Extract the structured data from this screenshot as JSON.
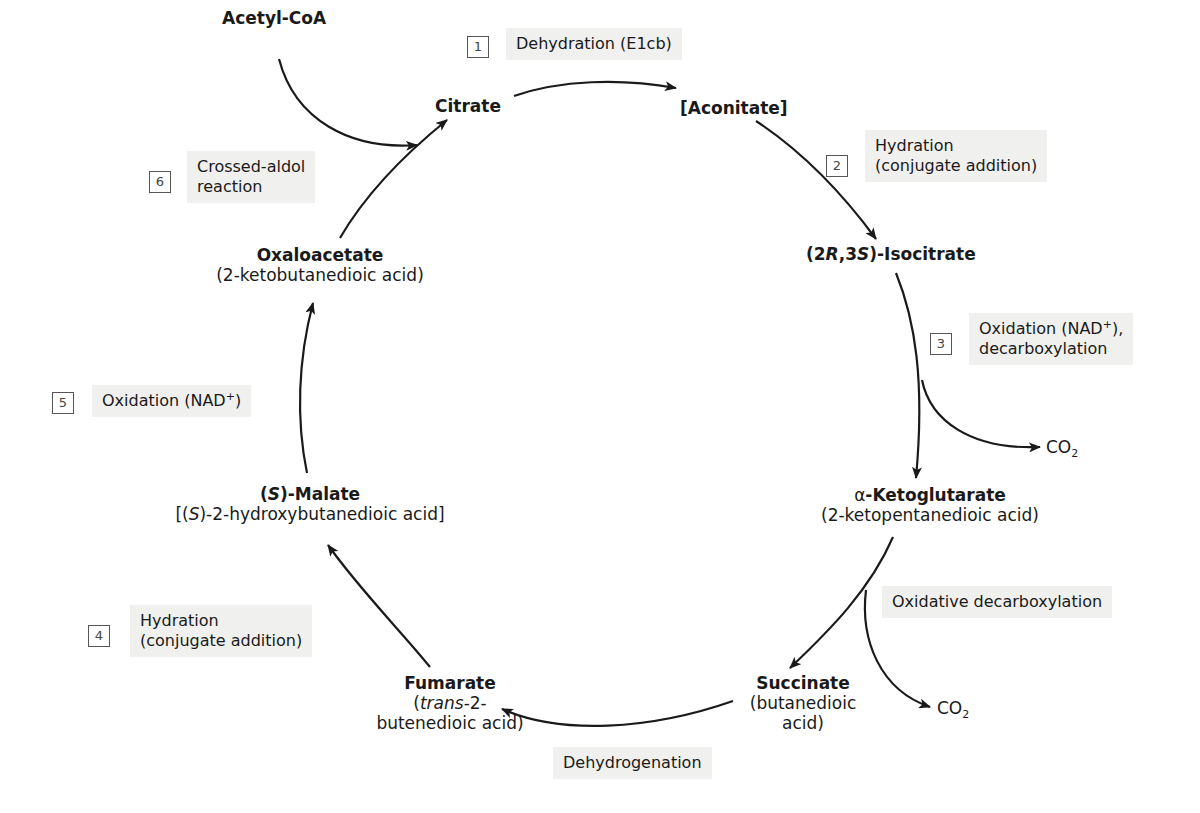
{
  "compounds": {
    "acetyl_coa": "Acetyl-CoA",
    "citrate": "Citrate",
    "aconitate": "[Aconitate]",
    "isocitrate_prefix": "(2",
    "isocitrate_r": "R",
    "isocitrate_mid": ",3",
    "isocitrate_s": "S",
    "isocitrate_suffix": ")-Isocitrate",
    "ketoglutarate_alpha": "α",
    "ketoglutarate_name": "-Ketoglutarate",
    "ketoglutarate_iupac": "(2-ketopentanedioic acid)",
    "succinate": "Succinate",
    "succinate_iupac_1": "(butanedioic",
    "succinate_iupac_2": "acid)",
    "fumarate": "Fumarate",
    "fumarate_iupac_open": "(",
    "fumarate_iupac_trans": "trans",
    "fumarate_iupac_rest": "-2-",
    "fumarate_iupac_2": "butenedioic acid)",
    "malate_open": "(",
    "malate_s": "S",
    "malate_rest": ")-Malate",
    "malate_iupac_open": "[(",
    "malate_iupac_s": "S",
    "malate_iupac_rest": ")-2-hydroxybutanedioic acid]",
    "oxaloacetate": "Oxaloacetate",
    "oxaloacetate_iupac": "(2-ketobutanedioic acid)",
    "co2_a": "CO",
    "co2_a_sub": "2",
    "co2_b": "CO",
    "co2_b_sub": "2"
  },
  "steps": [
    {
      "number": "1",
      "line1": "Dehydration (E1cb)"
    },
    {
      "number": "2",
      "line1": "Hydration",
      "line2": "(conjugate addition)"
    },
    {
      "number": "3",
      "line1_pre": "Oxidation (NAD",
      "line1_sup": "+",
      "line1_post": "),",
      "line2": "decarboxylation"
    },
    {
      "number": "4",
      "line1": "Hydration",
      "line2": "(conjugate addition)"
    },
    {
      "number": "5",
      "line1_pre": "Oxidation (NAD",
      "line1_sup": "+",
      "line1_post": ")"
    },
    {
      "number": "6",
      "line1": "Crossed-aldol",
      "line2": "reaction"
    }
  ],
  "unnumbered_steps": {
    "oxidative_decarboxylation": "Oxidative decarboxylation",
    "dehydrogenation": "Dehydrogenation"
  },
  "colors": {
    "label_bg": "#f0f0ee",
    "arrow": "#1a1a1a",
    "box_border": "#555555"
  }
}
